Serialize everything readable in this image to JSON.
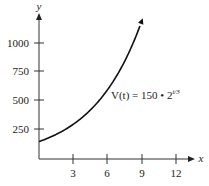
{
  "chart_data": {
    "type": "line",
    "title": "",
    "xlabel": "x",
    "ylabel": "y",
    "x_ticks": [
      3,
      6,
      9,
      12
    ],
    "y_ticks": [
      250,
      500,
      750,
      1000
    ],
    "xlim": [
      0,
      13
    ],
    "ylim": [
      0,
      1250
    ],
    "grid": false,
    "annotation": "V(t) = 150 • 2^(t/3)",
    "series": [
      {
        "name": "V(t) = 150 • 2^(t/3)",
        "x": [
          0,
          1,
          2,
          3,
          4,
          5,
          6,
          7,
          8,
          9
        ],
        "values": [
          150,
          189,
          238,
          300,
          378,
          476,
          600,
          756,
          952,
          1200
        ]
      }
    ]
  },
  "labels": {
    "x_axis": "x",
    "y_axis": "y",
    "xt": [
      "3",
      "6",
      "9",
      "12"
    ],
    "yt": [
      "250",
      "500",
      "750",
      "1000"
    ],
    "eq_main": "V(t) = 150 • 2",
    "eq_exp": "t/3"
  }
}
